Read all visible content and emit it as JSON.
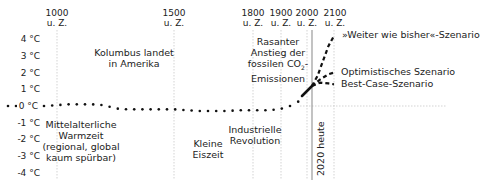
{
  "chart_data": {
    "type": "line",
    "title": "",
    "xlabel": "",
    "ylabel": "Temperaturabweichung",
    "ylim": [
      -4,
      4
    ],
    "grid": true,
    "y_ticks": [
      "4 °C",
      "3 °C",
      "2 °C",
      "1 °C",
      "0 °C",
      "-1 °C",
      "-2 °C",
      "-3 °C",
      "-4 °C"
    ],
    "x_ticks": [
      {
        "year": "1000",
        "era": "u. Z."
      },
      {
        "year": "1500",
        "era": "u. Z."
      },
      {
        "year": "1800",
        "era": "u. Z."
      },
      {
        "year": "1900",
        "era": "u. Z."
      },
      {
        "year": "2000",
        "era": "u. Z."
      },
      {
        "year": "2100",
        "era": "u. Z."
      }
    ],
    "series": [
      {
        "name": "Historische Temperatur",
        "style": "dotted",
        "x": [
          850,
          900,
          950,
          1000,
          1050,
          1100,
          1150,
          1200,
          1250,
          1300,
          1350,
          1400,
          1450,
          1500,
          1550,
          1600,
          1650,
          1700,
          1750,
          1800,
          1830,
          1860,
          1890,
          1920,
          1950,
          1980,
          2000,
          2020
        ],
        "values": [
          0.0,
          0.0,
          0.0,
          0.05,
          0.1,
          0.1,
          0.1,
          0.05,
          -0.15,
          -0.2,
          -0.2,
          -0.2,
          -0.2,
          -0.2,
          -0.25,
          -0.3,
          -0.3,
          -0.3,
          -0.25,
          -0.25,
          -0.25,
          -0.25,
          -0.2,
          -0.1,
          0.1,
          0.4,
          0.8,
          1.2
        ]
      },
      {
        "name": "»Weiter wie bisher«-Szenario",
        "style": "dashed",
        "x": [
          2020,
          2040,
          2060,
          2080,
          2100
        ],
        "values": [
          1.2,
          1.8,
          2.7,
          3.6,
          4.2
        ]
      },
      {
        "name": "Optimistisches Szenario",
        "style": "dashed",
        "x": [
          2020,
          2050,
          2080,
          2100
        ],
        "values": [
          1.2,
          1.6,
          1.9,
          2.0
        ]
      },
      {
        "name": "Best-Case-Szenario",
        "style": "dashed",
        "x": [
          2020,
          2050,
          2080,
          2100
        ],
        "values": [
          1.2,
          1.4,
          1.35,
          1.3
        ]
      }
    ],
    "annotations": [
      {
        "text": "Kolumbus landet in Amerika",
        "x": 1250,
        "y": 2.5
      },
      {
        "text": "Mittelalterliche Warmzeit (regional, global kaum spürbar)",
        "x": 1050,
        "y": -2
      },
      {
        "text": "Kleine Eiszeit",
        "x": 1650,
        "y": -2.5
      },
      {
        "text": "Industrielle Revolution",
        "x": 1820,
        "y": -2
      },
      {
        "text": "Rasanter Anstieg der fossilen CO2-Emissionen",
        "x": 1900,
        "y": 2.5
      },
      {
        "text": "2020 heute",
        "x": 2020,
        "y": -2.5
      }
    ]
  },
  "labels": {
    "kolumbus": [
      "Kolumbus landet",
      "in Amerika"
    ],
    "warmzeit": [
      "Mittelalterliche",
      "Warmzeit",
      "(regional, global",
      "kaum spürbar)"
    ],
    "eiszeit": [
      "Kleine",
      "Eiszeit"
    ],
    "industrie": [
      "Industrielle",
      "Revolution"
    ],
    "rasant": [
      "Rasanter",
      "Anstieg der",
      "fossilen CO",
      "2",
      "-",
      "Emissionen"
    ],
    "heute": "2020 heute",
    "scenario_weiter": "»Weiter wie bisher«-Szenario",
    "scenario_opt": "Optimistisches Szenario",
    "scenario_best": "Best-Case-Szenario"
  }
}
